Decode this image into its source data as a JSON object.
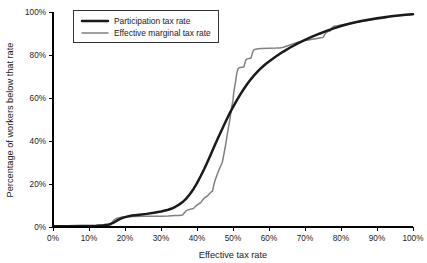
{
  "chart_data": {
    "type": "line",
    "title": "",
    "xlabel": "Effective tax rate",
    "ylabel": "Percentage of workers below that rate",
    "xlim": [
      0,
      100
    ],
    "ylim": [
      0,
      100
    ],
    "grid": false,
    "legend_position": "top-left",
    "x_tick_labels": [
      "0%",
      "10%",
      "20%",
      "30%",
      "40%",
      "50%",
      "60%",
      "70%",
      "80%",
      "90%",
      "100%"
    ],
    "x_tick_values": [
      0,
      10,
      20,
      30,
      40,
      50,
      60,
      70,
      80,
      90,
      100
    ],
    "y_tick_labels": [
      "0%",
      "20%",
      "40%",
      "60%",
      "80%",
      "100%"
    ],
    "y_tick_values": [
      0,
      20,
      40,
      60,
      80,
      100
    ],
    "series": [
      {
        "name": "Participation tax rate",
        "color": "#1a1a1a",
        "width": 2.5,
        "points": [
          [
            0,
            0.4
          ],
          [
            4,
            0.4
          ],
          [
            8,
            0.5
          ],
          [
            12,
            0.6
          ],
          [
            14,
            0.8
          ],
          [
            15,
            1.0
          ],
          [
            16,
            1.4
          ],
          [
            17,
            2.2
          ],
          [
            18,
            3.2
          ],
          [
            19,
            4.0
          ],
          [
            20,
            4.6
          ],
          [
            21,
            5.0
          ],
          [
            22,
            5.3
          ],
          [
            24,
            5.7
          ],
          [
            26,
            6.1
          ],
          [
            28,
            6.6
          ],
          [
            30,
            7.2
          ],
          [
            32,
            8.0
          ],
          [
            33,
            8.6
          ],
          [
            34,
            9.4
          ],
          [
            35,
            10.4
          ],
          [
            36,
            11.6
          ],
          [
            37,
            13.2
          ],
          [
            38,
            15.2
          ],
          [
            39,
            17.6
          ],
          [
            40,
            20.4
          ],
          [
            41,
            23.6
          ],
          [
            42,
            27.0
          ],
          [
            43,
            30.6
          ],
          [
            44,
            34.4
          ],
          [
            45,
            38.2
          ],
          [
            46,
            42.0
          ],
          [
            47,
            45.6
          ],
          [
            48,
            49.2
          ],
          [
            49,
            52.6
          ],
          [
            50,
            55.8
          ],
          [
            51,
            58.8
          ],
          [
            52,
            61.6
          ],
          [
            53,
            64.2
          ],
          [
            54,
            66.6
          ],
          [
            55,
            68.8
          ],
          [
            56,
            70.8
          ],
          [
            57,
            72.6
          ],
          [
            58,
            74.2
          ],
          [
            59,
            75.7
          ],
          [
            60,
            77.0
          ],
          [
            62,
            79.4
          ],
          [
            64,
            81.6
          ],
          [
            66,
            83.6
          ],
          [
            68,
            85.4
          ],
          [
            70,
            87.0
          ],
          [
            72,
            88.5
          ],
          [
            74,
            89.9
          ],
          [
            76,
            91.2
          ],
          [
            78,
            92.4
          ],
          [
            80,
            93.5
          ],
          [
            82,
            94.4
          ],
          [
            84,
            95.2
          ],
          [
            86,
            95.9
          ],
          [
            88,
            96.5
          ],
          [
            90,
            97.1
          ],
          [
            92,
            97.6
          ],
          [
            94,
            98.0
          ],
          [
            96,
            98.4
          ],
          [
            98,
            98.7
          ],
          [
            100,
            99.0
          ]
        ]
      },
      {
        "name": "Effective marginal tax rate",
        "color": "#808080",
        "width": 1.5,
        "points": [
          [
            0,
            0.4
          ],
          [
            8,
            0.4
          ],
          [
            14,
            0.5
          ],
          [
            15,
            0.6
          ],
          [
            16,
            1.0
          ],
          [
            16.5,
            2.2
          ],
          [
            17,
            3.4
          ],
          [
            18,
            4.2
          ],
          [
            19,
            4.6
          ],
          [
            20,
            4.8
          ],
          [
            22,
            4.9
          ],
          [
            25,
            5.0
          ],
          [
            28,
            5.0
          ],
          [
            30,
            5.0
          ],
          [
            32,
            5.1
          ],
          [
            33,
            5.2
          ],
          [
            34,
            5.3
          ],
          [
            35,
            5.4
          ],
          [
            36,
            5.6
          ],
          [
            36.5,
            6.6
          ],
          [
            37,
            7.6
          ],
          [
            38,
            8.2
          ],
          [
            39,
            8.6
          ],
          [
            39.5,
            9.4
          ],
          [
            40,
            10.2
          ],
          [
            40.5,
            10.8
          ],
          [
            41,
            11.2
          ],
          [
            41.5,
            12.4
          ],
          [
            42,
            13.4
          ],
          [
            42.5,
            14.0
          ],
          [
            43,
            14.6
          ],
          [
            43.5,
            15.6
          ],
          [
            44,
            16.4
          ],
          [
            44.3,
            16.6
          ],
          [
            44.6,
            19.0
          ],
          [
            45,
            21.6
          ],
          [
            45.5,
            24.0
          ],
          [
            46,
            26.2
          ],
          [
            46.5,
            28.0
          ],
          [
            47,
            30.0
          ],
          [
            47.3,
            32.4
          ],
          [
            47.6,
            35.0
          ],
          [
            48,
            38.6
          ],
          [
            48.3,
            42.0
          ],
          [
            48.6,
            45.0
          ],
          [
            49,
            48.6
          ],
          [
            49.3,
            52.0
          ],
          [
            49.6,
            55.4
          ],
          [
            50,
            59.0
          ],
          [
            50.2,
            62.4
          ],
          [
            50.5,
            65.6
          ],
          [
            50.8,
            68.6
          ],
          [
            51,
            71.0
          ],
          [
            51.3,
            73.2
          ],
          [
            51.6,
            74.0
          ],
          [
            52,
            74.2
          ],
          [
            52.5,
            74.3
          ],
          [
            53,
            74.4
          ],
          [
            53.3,
            76.2
          ],
          [
            53.6,
            77.8
          ],
          [
            54,
            78.2
          ],
          [
            54.5,
            78.4
          ],
          [
            55,
            78.6
          ],
          [
            55.3,
            80.4
          ],
          [
            55.6,
            82.0
          ],
          [
            56,
            82.6
          ],
          [
            57,
            82.9
          ],
          [
            58,
            83.0
          ],
          [
            60,
            83.1
          ],
          [
            62,
            83.2
          ],
          [
            63,
            83.3
          ],
          [
            64,
            83.6
          ],
          [
            65,
            84.2
          ],
          [
            66,
            84.8
          ],
          [
            67,
            85.4
          ],
          [
            68,
            85.9
          ],
          [
            69,
            86.3
          ],
          [
            70,
            86.7
          ],
          [
            71,
            87.0
          ],
          [
            72,
            87.3
          ],
          [
            73,
            87.6
          ],
          [
            74,
            87.9
          ],
          [
            75,
            88.2
          ],
          [
            75.5,
            89.6
          ],
          [
            76,
            90.6
          ],
          [
            76.5,
            91.0
          ],
          [
            77,
            91.2
          ],
          [
            77.5,
            92.6
          ],
          [
            78,
            93.4
          ],
          [
            79,
            93.6
          ],
          [
            80,
            93.9
          ],
          [
            82,
            94.5
          ],
          [
            84,
            95.1
          ],
          [
            86,
            95.7
          ],
          [
            88,
            96.2
          ],
          [
            90,
            96.7
          ],
          [
            92,
            97.1
          ],
          [
            93,
            97.6
          ],
          [
            94,
            98.0
          ],
          [
            96,
            98.4
          ],
          [
            98,
            98.7
          ],
          [
            100,
            99.0
          ]
        ]
      }
    ]
  },
  "legend": {
    "items": [
      {
        "label": "Participation tax rate"
      },
      {
        "label": "Effective marginal tax rate"
      }
    ]
  }
}
